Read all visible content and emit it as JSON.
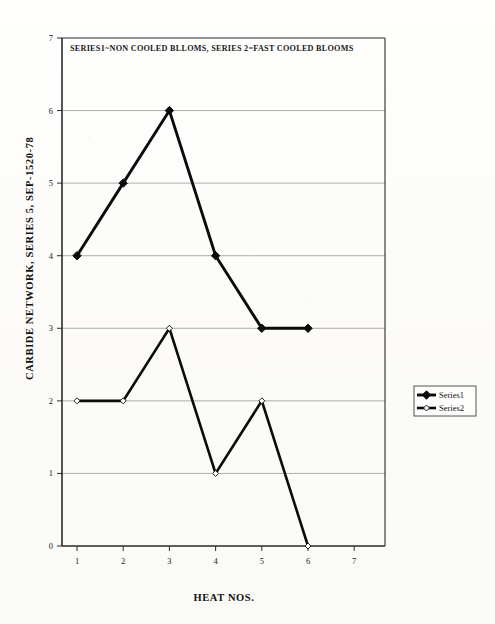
{
  "chart_data": {
    "type": "line",
    "title": "SERIES1~NON COOLED BLLOMS, SERIES 2=FAST COOLED BLOOMS",
    "xlabel": "HEAT NOS.",
    "ylabel": "CARBIDE NETWORK, SERIES 5, SEP-1520-78",
    "x": [
      1,
      2,
      3,
      4,
      5,
      6
    ],
    "xticks": [
      "1",
      "2",
      "3",
      "4",
      "5",
      "6",
      "7"
    ],
    "yticks": [
      "0",
      "1",
      "2",
      "3",
      "4",
      "5",
      "6",
      "7"
    ],
    "xlim": [
      0,
      7.6
    ],
    "ylim": [
      0,
      7
    ],
    "grid": "horizontal",
    "legend_position": "right-outside",
    "series": [
      {
        "name": "Series1",
        "marker": "filled-diamond",
        "color": "#0b0b0b",
        "values": [
          4,
          5,
          6,
          4,
          3,
          3
        ]
      },
      {
        "name": "Series2",
        "marker": "hollow-diamond",
        "color": "#0b0b0b",
        "values": [
          2,
          2,
          3,
          1,
          2,
          0
        ]
      }
    ]
  },
  "legend": {
    "entries": [
      {
        "label": "Series1"
      },
      {
        "label": "Series2"
      }
    ]
  },
  "colors": {
    "ink": "#0b0b0b",
    "grid": "#8c8c8c",
    "frame": "#2a2a2a",
    "paper": "#fdfdfb"
  }
}
